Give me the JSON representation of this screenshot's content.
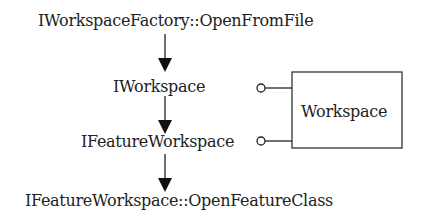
{
  "diagram": {
    "nodes": [
      {
        "id": "open-from-file",
        "label": "IWorkspaceFactory::OpenFromFile"
      },
      {
        "id": "iworkspace",
        "label": "IWorkspace"
      },
      {
        "id": "ifeatureworkspace",
        "label": "IFeatureWorkspace"
      },
      {
        "id": "open-feature-class",
        "label": "IFeatureWorkspace::OpenFeatureClass"
      }
    ],
    "class_box": {
      "label": "Workspace"
    },
    "edges": [
      {
        "from": "open-from-file",
        "to": "iworkspace",
        "type": "arrow"
      },
      {
        "from": "iworkspace",
        "to": "ifeatureworkspace",
        "type": "arrow"
      },
      {
        "from": "ifeatureworkspace",
        "to": "open-feature-class",
        "type": "arrow"
      }
    ],
    "interfaces": [
      {
        "interface": "iworkspace",
        "implemented_by": "Workspace",
        "type": "lollipop"
      },
      {
        "interface": "ifeatureworkspace",
        "implemented_by": "Workspace",
        "type": "lollipop"
      }
    ],
    "colors": {
      "stroke": "#222222",
      "text": "#222222",
      "background": "#ffffff"
    }
  }
}
